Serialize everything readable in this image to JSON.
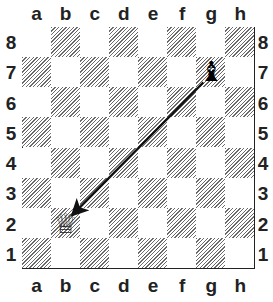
{
  "board": {
    "files": [
      "a",
      "b",
      "c",
      "d",
      "e",
      "f",
      "g",
      "h"
    ],
    "ranks": [
      "8",
      "7",
      "6",
      "5",
      "4",
      "3",
      "2",
      "1"
    ],
    "pieces": [
      {
        "square": "g7",
        "piece": "black-bishop",
        "glyph": "♝"
      },
      {
        "square": "b2",
        "piece": "white-queen",
        "glyph": "♕"
      }
    ],
    "arrow": {
      "from": "g7",
      "to": "b2",
      "color": "#111111"
    }
  }
}
